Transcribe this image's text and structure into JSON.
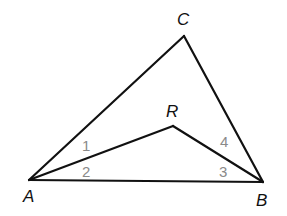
{
  "diagram": {
    "type": "triangle-with-interior-point",
    "points": {
      "A": {
        "x": 29,
        "y": 180
      },
      "B": {
        "x": 263,
        "y": 182
      },
      "C": {
        "x": 184,
        "y": 36
      },
      "R": {
        "x": 173,
        "y": 126
      }
    },
    "segments": [
      [
        "A",
        "C"
      ],
      [
        "C",
        "B"
      ],
      [
        "A",
        "B"
      ],
      [
        "A",
        "R"
      ],
      [
        "R",
        "B"
      ]
    ],
    "vertex_labels": {
      "A": {
        "text": "A",
        "x": 23,
        "y": 202
      },
      "B": {
        "text": "B",
        "x": 256,
        "y": 206
      },
      "C": {
        "text": "C",
        "x": 177,
        "y": 25
      },
      "R": {
        "text": "R",
        "x": 166,
        "y": 117
      }
    },
    "angle_labels": [
      {
        "text": "1",
        "x": 82,
        "y": 151
      },
      {
        "text": "2",
        "x": 82,
        "y": 177
      },
      {
        "text": "3",
        "x": 219,
        "y": 177
      },
      {
        "text": "4",
        "x": 220,
        "y": 147
      }
    ],
    "colors": {
      "line": "#111111",
      "angle_label": "#8a8a8a"
    }
  }
}
